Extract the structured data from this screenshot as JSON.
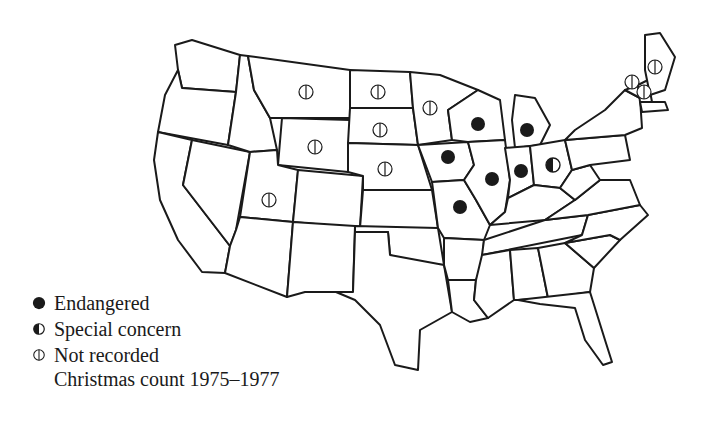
{
  "map": {
    "region": "Contiguous United States",
    "legend": {
      "items": [
        {
          "symbol": "filled-circle",
          "label": "Endangered"
        },
        {
          "symbol": "half-filled-circle",
          "label": "Special concern"
        },
        {
          "symbol": "barred-circle",
          "label": "Not recorded"
        }
      ],
      "note": "Christmas count 1975–1977"
    },
    "states": {
      "endangered": [
        "Wisconsin",
        "Michigan",
        "Iowa",
        "Illinois",
        "Indiana",
        "Missouri"
      ],
      "special_concern": [
        "Ohio"
      ],
      "not_recorded": [
        "Montana",
        "North Dakota",
        "South Dakota",
        "Minnesota",
        "Wyoming",
        "Nebraska",
        "Utah",
        "Maine",
        "Vermont",
        "New Hampshire"
      ]
    },
    "colors": {
      "ink": "#1a1a1a",
      "background": "#ffffff"
    }
  }
}
